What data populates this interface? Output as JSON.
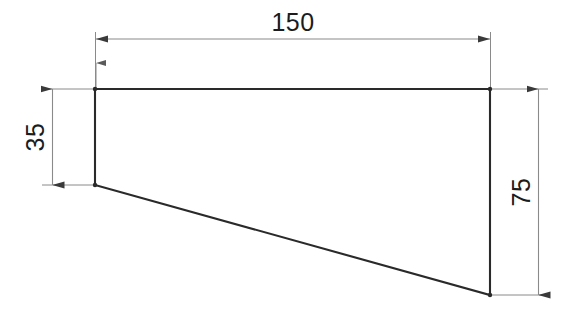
{
  "drawing": {
    "title": "Trapezoidal profile engineering drawing",
    "background_color": "#ffffff",
    "outline_color": "#2a2a2a",
    "dimension_line_color": "#8a8a8a",
    "text_color": "#1c1c1c",
    "units": "mm",
    "shape": {
      "type": "trapezoid",
      "vertices": [
        {
          "name": "top-left",
          "x": 95,
          "y": 89
        },
        {
          "name": "top-right",
          "x": 490,
          "y": 89
        },
        {
          "name": "bottom-right",
          "x": 490,
          "y": 295
        },
        {
          "name": "bottom-left",
          "x": 95,
          "y": 185
        }
      ]
    },
    "dimensions": [
      {
        "id": "width",
        "label": "150",
        "orientation": "horizontal",
        "position": "top",
        "value": 150
      },
      {
        "id": "left-height",
        "label": "35",
        "orientation": "vertical",
        "position": "left",
        "value": 35
      },
      {
        "id": "right-height",
        "label": "75",
        "orientation": "vertical",
        "position": "right",
        "value": 75
      }
    ]
  }
}
